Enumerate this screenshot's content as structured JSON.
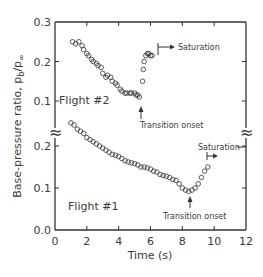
{
  "chart_data": {
    "type": "scatter",
    "title": "",
    "xlabel": "Time (s)",
    "ylabel": "Base-pressure ratio, p_b/p_∞",
    "ylabel_main": "Base-pressure ratio, p",
    "ylabel_sub": "b",
    "ylabel_slash": "/p",
    "ylabel_sub2": "∞",
    "xlim": [
      0,
      12
    ],
    "x_ticks": [
      0,
      2,
      4,
      6,
      8,
      10,
      12
    ],
    "x_tick_labels": [
      "0",
      "2",
      "4",
      "6",
      "8",
      "10",
      "12"
    ],
    "panels": [
      {
        "name": "upper",
        "ylim": [
          0.1,
          0.3
        ],
        "y_tick_labels": [
          "0.3",
          "0.2",
          "0.1"
        ]
      },
      {
        "name": "lower",
        "ylim": [
          0.0,
          0.25
        ],
        "y_tick_labels": [
          "0.2",
          "0.1",
          "0.0"
        ]
      }
    ],
    "axis_break_symbol": "≈",
    "grid": false,
    "legend": null,
    "series": [
      {
        "name": "Flight #2",
        "panel": "upper",
        "marker": "open-circle",
        "x": [
          1.1,
          1.3,
          1.5,
          1.7,
          1.8,
          2.0,
          2.1,
          2.3,
          2.4,
          2.6,
          2.7,
          2.9,
          3.0,
          3.2,
          3.3,
          3.5,
          3.6,
          3.8,
          3.9,
          4.1,
          4.2,
          4.4,
          4.5,
          4.7,
          4.8,
          5.0,
          5.1,
          5.2,
          5.3,
          5.5,
          5.55,
          5.6,
          5.7,
          5.8,
          5.9,
          6.0,
          6.1
        ],
        "y": [
          0.25,
          0.245,
          0.25,
          0.24,
          0.23,
          0.22,
          0.215,
          0.205,
          0.2,
          0.195,
          0.19,
          0.185,
          0.17,
          0.16,
          0.165,
          0.16,
          0.15,
          0.145,
          0.14,
          0.13,
          0.125,
          0.12,
          0.12,
          0.12,
          0.12,
          0.12,
          0.115,
          0.115,
          0.11,
          0.15,
          0.18,
          0.2,
          0.215,
          0.22,
          0.22,
          0.215,
          0.215
        ]
      },
      {
        "name": "Flight #1",
        "panel": "lower",
        "marker": "open-circle",
        "x": [
          1.0,
          1.2,
          1.4,
          1.6,
          1.8,
          2.0,
          2.2,
          2.4,
          2.6,
          2.8,
          3.0,
          3.2,
          3.4,
          3.6,
          3.8,
          4.0,
          4.2,
          4.4,
          4.6,
          4.8,
          5.0,
          5.2,
          5.4,
          5.6,
          5.8,
          6.0,
          6.2,
          6.4,
          6.6,
          6.8,
          7.0,
          7.2,
          7.4,
          7.6,
          7.8,
          8.0,
          8.2,
          8.4,
          8.6,
          8.8,
          9.0,
          9.2,
          9.4,
          9.6
        ],
        "y": [
          0.255,
          0.25,
          0.24,
          0.235,
          0.23,
          0.22,
          0.215,
          0.21,
          0.205,
          0.2,
          0.195,
          0.19,
          0.185,
          0.18,
          0.178,
          0.175,
          0.17,
          0.165,
          0.162,
          0.16,
          0.158,
          0.155,
          0.15,
          0.15,
          0.148,
          0.145,
          0.14,
          0.138,
          0.132,
          0.13,
          0.128,
          0.125,
          0.12,
          0.118,
          0.11,
          0.1,
          0.095,
          0.092,
          0.095,
          0.1,
          0.11,
          0.125,
          0.14,
          0.15
        ]
      }
    ],
    "annotations": [
      {
        "text": "Saturation",
        "panel": "upper",
        "x": 6.0,
        "y": 0.23
      },
      {
        "text": "Transition onset",
        "panel": "upper",
        "x": 5.4,
        "y": 0.11
      },
      {
        "text": "Saturation",
        "panel": "lower",
        "x": 9.6,
        "y": 0.2
      },
      {
        "text": "Transition onset",
        "panel": "lower",
        "x": 8.5,
        "y": 0.09
      }
    ]
  },
  "labels": {
    "flight2": "Flight  #2",
    "flight1": "Flight  #1",
    "saturation": "Saturation",
    "transition": "Transition onset",
    "xlabel": "Time  (s)",
    "break": "≈"
  },
  "ticks": {
    "x": [
      "0",
      "2",
      "4",
      "6",
      "8",
      "10",
      "12"
    ],
    "y_upper": [
      "0.3",
      "0.2",
      "0.1"
    ],
    "y_lower": [
      "0.2",
      "0.1",
      "0.0"
    ]
  }
}
